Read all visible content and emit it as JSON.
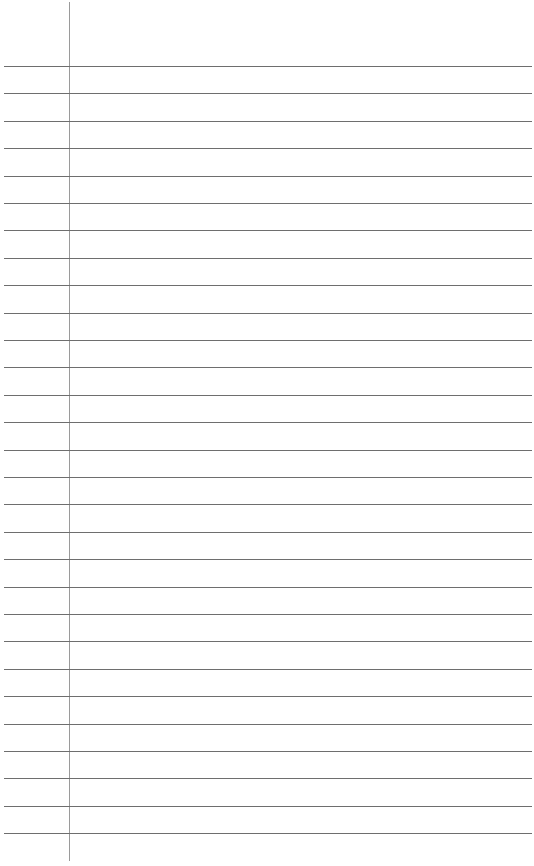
{
  "page": {
    "type": "blank lined notebook paper",
    "width": 534,
    "height": 866,
    "background": "#ffffff"
  },
  "margin_line": {
    "x": 69,
    "top": 2,
    "bottom": 861,
    "color": "#9a9a9a"
  },
  "ruled_lines": {
    "count": 29,
    "first_y": 66,
    "spacing": 27.4,
    "left": 4,
    "right": 532,
    "color": "#6e6e6e"
  }
}
